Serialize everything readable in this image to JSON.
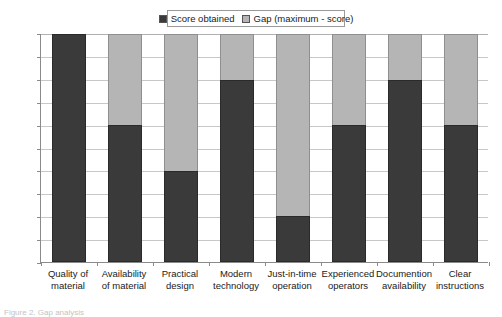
{
  "chart_data": {
    "type": "bar",
    "subtype": "stacked-bar",
    "title": "",
    "xlabel": "",
    "ylabel": "",
    "ylim": [
      0,
      5
    ],
    "ytick_step": 0.5,
    "grid": true,
    "legend_position": "top-center",
    "categories": [
      "Quality of material",
      "Availability of material",
      "Practical design",
      "Modern technology",
      "Just-in-time operation",
      "Experienced operators",
      "Documention availability",
      "Clear instructions"
    ],
    "category_lines": [
      [
        "Quality of",
        "material"
      ],
      [
        "Availability",
        "of material"
      ],
      [
        "Practical",
        "design"
      ],
      [
        "Modern",
        "technology"
      ],
      [
        "Just-in-time",
        "operation"
      ],
      [
        "Experienced",
        "operators"
      ],
      [
        "Documention",
        "availability"
      ],
      [
        "Clear",
        "instructions"
      ]
    ],
    "series": [
      {
        "name": "Score obtained",
        "color": "#3a3a3a",
        "values": [
          5,
          3,
          2,
          4,
          1,
          3,
          4,
          3
        ]
      },
      {
        "name": "Gap (maximum - score)",
        "color": "#b5b5b5",
        "values": [
          0,
          2,
          3,
          1,
          4,
          2,
          1,
          2
        ]
      }
    ],
    "ytick_labels": [
      "5.00",
      "4.50",
      "4.00",
      "3.50",
      "3.00",
      "2.50",
      "2.00",
      "1.50",
      "1.00",
      "0.50",
      "0.00"
    ],
    "ytick_values": [
      5,
      4.5,
      4,
      3.5,
      3,
      2.5,
      2,
      1.5,
      1,
      0.5,
      0
    ]
  },
  "legend": {
    "entries": [
      {
        "label": "Score obtained",
        "color": "#3a3a3a"
      },
      {
        "label": "Gap (maximum - score)",
        "color": "#b5b5b5"
      }
    ]
  },
  "caption": {
    "text": "Figure 2. Gap analysis"
  }
}
